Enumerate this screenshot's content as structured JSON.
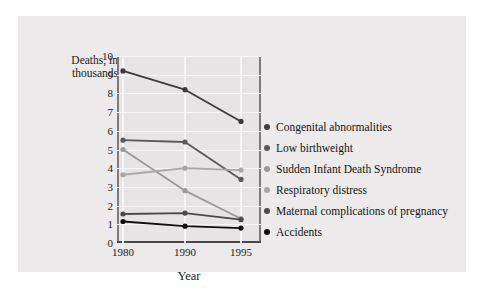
{
  "chart_data": {
    "type": "line",
    "title": "",
    "xlabel": "Year",
    "ylabel": "Deaths, in thousands",
    "categories": [
      "1980",
      "1990",
      "1995"
    ],
    "x": [
      1980,
      1990,
      1995
    ],
    "ylim": [
      0,
      10
    ],
    "yticks": [
      "0",
      "1",
      "2",
      "3",
      "4",
      "5",
      "6",
      "7",
      "8",
      "9",
      "10"
    ],
    "grid": true,
    "legend_position": "right",
    "series": [
      {
        "name": "Congenital abnormalities",
        "values": [
          9.2,
          8.2,
          6.5
        ],
        "color": "#3c3c3c"
      },
      {
        "name": "Low birthweight",
        "values": [
          5.5,
          5.4,
          3.4
        ],
        "color": "#5a5a5a"
      },
      {
        "name": "Sudden Infant Death Syndrome",
        "values": [
          5.0,
          2.8,
          1.3
        ],
        "color": "#9a9a9a"
      },
      {
        "name": "Respiratory distress",
        "values": [
          3.65,
          4.0,
          3.9
        ],
        "color": "#a8a8a8"
      },
      {
        "name": "Maternal complications of pregnancy",
        "values": [
          1.55,
          1.6,
          1.25
        ],
        "color": "#4a4a4a"
      },
      {
        "name": "Accidents",
        "values": [
          1.15,
          0.9,
          0.8
        ],
        "color": "#101010"
      }
    ]
  },
  "colors": {
    "panel_background": "#eceaea",
    "plot_background": "#e6e4e4",
    "top_bar": "#111111",
    "grid": "#f7f6f6",
    "axis": "#7c7c7c",
    "text": "#1b1b1b"
  }
}
